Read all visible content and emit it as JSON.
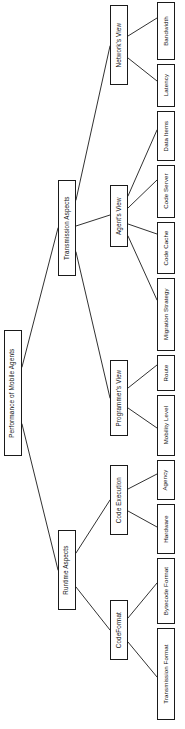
{
  "diagram": {
    "type": "tree",
    "title": "Performance of Mobile Agents",
    "orientation": "left-to-right, text rotated 90 degrees counter-clockwise",
    "colors": {
      "background": "#ffffff",
      "node_border": "#1a1a1a",
      "node_fill": "#ffffff",
      "edge": "#1a1a1a",
      "text": "#111111"
    },
    "nodes": {
      "root": {
        "label": "Performance of Mobile Agents"
      },
      "transmission_aspects": {
        "label": "Transmission Aspects"
      },
      "runtime_aspects": {
        "label": "Runtime Aspects"
      },
      "networks_view": {
        "label": "Network's View"
      },
      "agents_view": {
        "label": "Agent's View"
      },
      "programmers_view": {
        "label": "Programmer's View"
      },
      "code_execution": {
        "label": "Code Execution"
      },
      "code_format": {
        "label": "CodeFormat"
      },
      "bandwidth": {
        "label": "Bandwidth"
      },
      "latency": {
        "label": "Latency"
      },
      "data_items": {
        "label": "Data Items"
      },
      "code_server": {
        "label": "Code Server"
      },
      "code_cache": {
        "label": "Code Cache"
      },
      "migration_strategy": {
        "label": "Migration Strategy"
      },
      "route": {
        "label": "Route"
      },
      "mobility_level": {
        "label": "Mobility Level"
      },
      "agency": {
        "label": "Agency"
      },
      "hardware": {
        "label": "Hardware"
      },
      "bytecode_format": {
        "label": "Bytecode Format"
      },
      "transmission_format": {
        "label": "Transmission Format"
      }
    },
    "edges": [
      {
        "from": "root",
        "to": "transmission_aspects"
      },
      {
        "from": "root",
        "to": "runtime_aspects"
      },
      {
        "from": "transmission_aspects",
        "to": "networks_view"
      },
      {
        "from": "transmission_aspects",
        "to": "agents_view"
      },
      {
        "from": "transmission_aspects",
        "to": "programmers_view"
      },
      {
        "from": "runtime_aspects",
        "to": "code_execution"
      },
      {
        "from": "runtime_aspects",
        "to": "code_format"
      },
      {
        "from": "networks_view",
        "to": "bandwidth"
      },
      {
        "from": "networks_view",
        "to": "latency"
      },
      {
        "from": "agents_view",
        "to": "data_items"
      },
      {
        "from": "agents_view",
        "to": "code_server"
      },
      {
        "from": "agents_view",
        "to": "code_cache"
      },
      {
        "from": "agents_view",
        "to": "migration_strategy"
      },
      {
        "from": "programmers_view",
        "to": "route"
      },
      {
        "from": "programmers_view",
        "to": "mobility_level"
      },
      {
        "from": "code_execution",
        "to": "agency"
      },
      {
        "from": "code_execution",
        "to": "hardware"
      },
      {
        "from": "code_format",
        "to": "bytecode_format"
      },
      {
        "from": "code_format",
        "to": "transmission_format"
      }
    ]
  }
}
